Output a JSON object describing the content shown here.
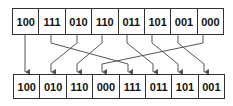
{
  "top_row": [
    "100",
    "111",
    "010",
    "110",
    "011",
    "101",
    "001",
    "000"
  ],
  "bottom_row": [
    "100",
    "010",
    "110",
    "000",
    "111",
    "011",
    "101",
    "001"
  ],
  "colors": {
    "line": "#555555",
    "border": "#333333",
    "text": "#111111"
  }
}
